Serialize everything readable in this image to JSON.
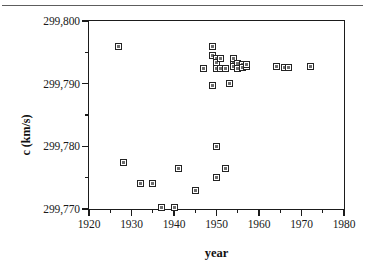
{
  "figure": {
    "kind": "scatter-plot",
    "background_color": "#ffffff",
    "frame_color": "#1b1b1b",
    "marker_edge_color": "#232323",
    "marker_fill_color": "#6e6e6e"
  },
  "chart_data": {
    "type": "scatter",
    "title": "",
    "subtitle": "",
    "xlabel": "year",
    "ylabel": "c (km/s)",
    "xlim": [
      1920,
      1980
    ],
    "ylim": [
      299770,
      299800
    ],
    "xticks": [
      1920,
      1930,
      1940,
      1950,
      1960,
      1970,
      1980
    ],
    "xticklabels": [
      "1920",
      "1930",
      "1940",
      "1950",
      "1960",
      "1970",
      "1980"
    ],
    "xminor_ticks": [
      1925,
      1935,
      1945,
      1955,
      1965,
      1975
    ],
    "yticks": [
      299770,
      299780,
      299790,
      299800
    ],
    "yticklabels": [
      "299,770",
      "299,780",
      "299,790",
      "299,800"
    ],
    "yminor_ticks": [
      299775,
      299785,
      299795
    ],
    "grid": false,
    "legend": null,
    "marker_style": "open-square",
    "series": [
      {
        "name": "speed of light measurements",
        "x": [
          1927,
          1928,
          1932,
          1935,
          1937,
          1940,
          1941,
          1945,
          1947,
          1949,
          1949,
          1949,
          1950,
          1950,
          1950,
          1950,
          1950,
          1951,
          1951,
          1952,
          1952,
          1953,
          1954,
          1954,
          1954,
          1955,
          1955,
          1955,
          1956,
          1956,
          1957,
          1957,
          1964,
          1966,
          1967,
          1972
        ],
        "y": [
          299796.0,
          299777.5,
          299774.0,
          299774.0,
          299770.3,
          299770.3,
          299776.5,
          299773.0,
          299792.5,
          299796.0,
          299789.7,
          299794.5,
          299794.0,
          299792.5,
          299780.0,
          299775.0,
          299793.3,
          299792.5,
          299794.0,
          299792.5,
          299776.5,
          299790.0,
          299793.5,
          299792.8,
          299794.0,
          299792.8,
          299793.2,
          299792.5,
          299793.0,
          299792.6,
          299792.8,
          299793.0,
          299792.8,
          299792.6,
          299792.6,
          299792.7
        ]
      }
    ]
  }
}
